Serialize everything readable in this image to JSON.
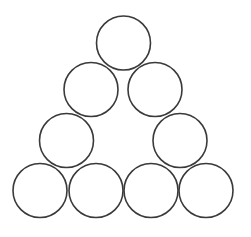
{
  "diagram": {
    "title": "",
    "shape": "triangle-of-circles",
    "stroke_color": "#3a3a3a",
    "background_color": "#ffffff",
    "rows": [
      {
        "row": 1,
        "circle_count": 1
      },
      {
        "row": 2,
        "circle_count": 2
      },
      {
        "row": 3,
        "circle_count": 2
      },
      {
        "row": 4,
        "circle_count": 4
      }
    ],
    "total_circles": 9,
    "circles": [
      {
        "id": "circle-row1-1",
        "row": 1,
        "index": 1
      },
      {
        "id": "circle-row2-1",
        "row": 2,
        "index": 1
      },
      {
        "id": "circle-row2-2",
        "row": 2,
        "index": 2
      },
      {
        "id": "circle-row3-1",
        "row": 3,
        "index": 1
      },
      {
        "id": "circle-row3-2",
        "row": 3,
        "index": 2
      },
      {
        "id": "circle-row4-1",
        "row": 4,
        "index": 1
      },
      {
        "id": "circle-row4-2",
        "row": 4,
        "index": 2
      },
      {
        "id": "circle-row4-3",
        "row": 4,
        "index": 3
      },
      {
        "id": "circle-row4-4",
        "row": 4,
        "index": 4
      }
    ]
  }
}
